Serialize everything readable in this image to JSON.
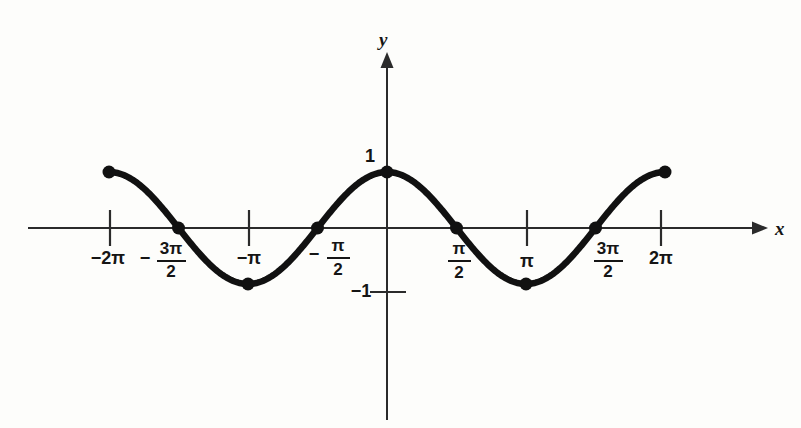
{
  "figure": {
    "background_color": "#fdfdfb",
    "ink_color": "#111111",
    "axis_color": "#2b2b2b"
  },
  "axes": {
    "x_label": "x",
    "y_label": "y",
    "x_axis_y_px": 228,
    "y_axis_x_px": 387,
    "px_per_pi": 139,
    "px_per_unit_y": 56
  },
  "chart_data": {
    "type": "line",
    "title": "",
    "subtitle": "",
    "xlabel": "x",
    "ylabel": "y",
    "function": "y = cos x",
    "xlim": [
      -6.283185,
      6.283185
    ],
    "ylim": [
      -1,
      1
    ],
    "grid": false,
    "legend": null,
    "x_tick_labels": [
      "-2π",
      "-3π/2",
      "-π",
      "-π/2",
      "π/2",
      "π",
      "3π/2",
      "2π"
    ],
    "x_tick_values": [
      -6.283185,
      -4.712389,
      -3.141593,
      -1.570796,
      1.570796,
      3.141593,
      4.712389,
      6.283185
    ],
    "x_ticks_with_marks": [
      -6.283185,
      -3.141593,
      3.141593,
      6.283185
    ],
    "y_tick_labels": [
      "1",
      "-1"
    ],
    "y_tick_values": [
      1,
      -1
    ],
    "marked_points": [
      {
        "x": -6.283185,
        "y": 1,
        "label": "-2π"
      },
      {
        "x": -4.712389,
        "y": 0,
        "label": "-3π/2"
      },
      {
        "x": -3.141593,
        "y": -1,
        "label": "-π"
      },
      {
        "x": -1.570796,
        "y": 0,
        "label": "-π/2"
      },
      {
        "x": 0,
        "y": 1,
        "label": "0"
      },
      {
        "x": 1.570796,
        "y": 0,
        "label": "π/2"
      },
      {
        "x": 3.141593,
        "y": -1,
        "label": "π"
      },
      {
        "x": 4.712389,
        "y": 0,
        "label": "3π/2"
      },
      {
        "x": 6.283185,
        "y": 1,
        "label": "2π"
      }
    ],
    "series": [
      {
        "name": "y = cos x",
        "x": [
          -6.283185,
          -5.89,
          -5.5,
          -5.11,
          -4.712389,
          -4.32,
          -3.93,
          -3.53,
          -3.141593,
          -2.75,
          -2.36,
          -1.96,
          -1.570796,
          -1.18,
          -0.785,
          -0.39,
          0,
          0.39,
          0.785,
          1.18,
          1.570796,
          1.96,
          2.36,
          2.75,
          3.141593,
          3.53,
          3.93,
          4.32,
          4.712389,
          5.11,
          5.5,
          5.89,
          6.283185
        ],
        "values": [
          1,
          0.924,
          0.707,
          0.383,
          0,
          -0.383,
          -0.707,
          -0.924,
          -1,
          -0.924,
          -0.707,
          -0.383,
          0,
          0.383,
          0.707,
          0.924,
          1,
          0.924,
          0.707,
          0.383,
          0,
          -0.383,
          -0.707,
          -0.924,
          -1,
          -0.924,
          -0.707,
          -0.383,
          0,
          0.383,
          0.707,
          0.924,
          1
        ]
      }
    ]
  },
  "tick_labels": {
    "neg_2pi": {
      "sign": "−",
      "text": "2π"
    },
    "neg_3pi_over_2": {
      "sign": "−",
      "num": "3π",
      "den": "2"
    },
    "neg_pi": {
      "sign": "−",
      "text": "π"
    },
    "neg_pi_over_2": {
      "sign": "−",
      "num": "π",
      "den": "2"
    },
    "pi_over_2": {
      "num": "π",
      "den": "2"
    },
    "pi": {
      "text": "π"
    },
    "3pi_over_2": {
      "num": "3π",
      "den": "2"
    },
    "2pi": {
      "text": "2π"
    },
    "y_one": "1",
    "y_neg_one": "−1"
  }
}
